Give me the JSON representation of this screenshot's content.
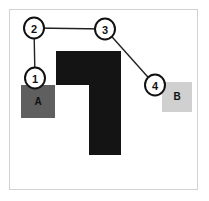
{
  "figure": {
    "title": "",
    "frame": {
      "x": 9,
      "y": 9,
      "width": 189,
      "height": 181,
      "border_color": "#d2d2d2",
      "background": "#ffffff"
    },
    "canvas": {
      "width": 209,
      "height": 201
    }
  },
  "chart_data": {
    "type": "diagram",
    "title": "",
    "xlabel": "",
    "ylabel": "",
    "nodes": [
      {
        "id": "1",
        "label": "1",
        "cx": 35,
        "cy": 78,
        "rx": 10,
        "ry": 10.5,
        "fill": "#ffffff",
        "stroke": "#111111"
      },
      {
        "id": "2",
        "label": "2",
        "cx": 34,
        "cy": 28,
        "rx": 10,
        "ry": 10.5,
        "fill": "#ffffff",
        "stroke": "#111111"
      },
      {
        "id": "3",
        "label": "3",
        "cx": 105,
        "cy": 29,
        "rx": 10,
        "ry": 10.5,
        "fill": "#ffffff",
        "stroke": "#111111"
      },
      {
        "id": "4",
        "label": "4",
        "cx": 155,
        "cy": 85,
        "rx": 10,
        "ry": 10.5,
        "fill": "#ffffff",
        "stroke": "#111111"
      }
    ],
    "edges": [
      {
        "from": "1",
        "to": "2",
        "x1": 35,
        "y1": 78,
        "x2": 34,
        "y2": 28
      },
      {
        "from": "2",
        "to": "3",
        "x1": 34,
        "y1": 28,
        "x2": 105,
        "y2": 29
      },
      {
        "from": "3",
        "to": "4",
        "x1": 105,
        "y1": 29,
        "x2": 155,
        "y2": 85
      }
    ],
    "regions": [
      {
        "id": "A",
        "label": "A",
        "x": 21,
        "y": 85,
        "width": 34,
        "height": 33,
        "fill": "#5f5f5f",
        "label_x": 38,
        "label_y": 101
      },
      {
        "id": "B",
        "label": "B",
        "x": 162,
        "y": 82,
        "width": 30,
        "height": 30,
        "fill": "#d0d0d0",
        "label_x": 177,
        "label_y": 96
      }
    ],
    "obstacles": [
      {
        "id": "obstacle-l-shape",
        "fill": "#141414",
        "points": "56,51 121,51 121,155 89,155 89,85 56,85"
      }
    ],
    "colors": {
      "obstacle": "#141414",
      "region_a": "#5f5f5f",
      "region_b": "#d0d0d0",
      "node_stroke": "#111111",
      "node_fill": "#ffffff",
      "edge": "#222222",
      "frame_border": "#d2d2d2"
    }
  }
}
